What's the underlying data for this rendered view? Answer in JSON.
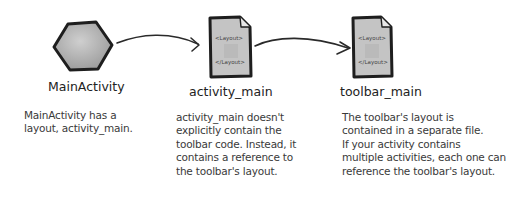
{
  "diagram": {
    "nodes": [
      {
        "id": "main-activity",
        "label": "MainActivity",
        "shape": "hexagon",
        "description": "MainActivity has a\nlayout, activity_main."
      },
      {
        "id": "activity-main",
        "label": "activity_main",
        "shape": "document",
        "doc_open_tag": "<Layout>",
        "doc_close_tag": "</Layout>",
        "description": "activity_main doesn't\nexplicitly contain the\ntoolbar code. Instead, it\ncontains a reference to\nthe toolbar's layout."
      },
      {
        "id": "toolbar-main",
        "label": "toolbar_main",
        "shape": "document",
        "doc_open_tag": "<Layout>",
        "doc_close_tag": "</Layout>",
        "description": "The toolbar's layout is\ncontained in a separate file.\nIf your activity contains\nmultiple activities, each one can\nreference the toolbar's layout."
      }
    ],
    "edges": [
      {
        "from": "main-activity",
        "to": "activity-main"
      },
      {
        "from": "activity-main",
        "to": "toolbar-main"
      }
    ],
    "colors": {
      "shape_fill": "#b5b5b5",
      "shape_stroke": "#1e1e1e",
      "arrow": "#2a2a2a",
      "text": "#2a2a2a"
    }
  }
}
